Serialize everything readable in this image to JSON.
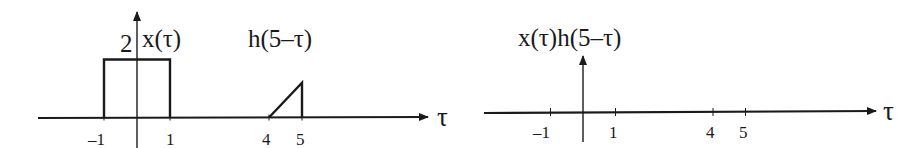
{
  "chart_data": [
    {
      "type": "line",
      "title": "",
      "xlabel": "τ",
      "ylabel": "",
      "x_ticks": [
        -1,
        1,
        4,
        5
      ],
      "xlim": [
        -3,
        8.8
      ],
      "series": [
        {
          "name": "x(τ)",
          "label": "x(τ)",
          "shape": "rectangle",
          "points": [
            [
              -1,
              0
            ],
            [
              -1,
              2
            ],
            [
              1,
              2
            ],
            [
              1,
              0
            ]
          ],
          "amplitude_label": "2"
        },
        {
          "name": "h(5−τ)",
          "label": "h(5–τ)",
          "shape": "ramp",
          "points": [
            [
              4,
              0
            ],
            [
              5,
              1.2
            ],
            [
              5,
              0
            ]
          ]
        }
      ]
    },
    {
      "type": "line",
      "title": "",
      "xlabel": "τ",
      "ylabel": "x(τ)h(5–τ)",
      "x_ticks": [
        -1,
        1,
        4,
        5
      ],
      "xlim": [
        -3,
        8.8
      ],
      "series": [
        {
          "name": "x(τ)h(5−τ)",
          "label": "x(τ)h(5–τ)",
          "shape": "zero",
          "points": []
        }
      ]
    }
  ],
  "labels": {
    "tau": "τ",
    "amp": "2",
    "x_tau": "x(τ)",
    "h_shift": "h(5–τ)",
    "product": "x(τ)h(5–τ)",
    "ticks": [
      "–1",
      "1",
      "4",
      "5"
    ]
  }
}
